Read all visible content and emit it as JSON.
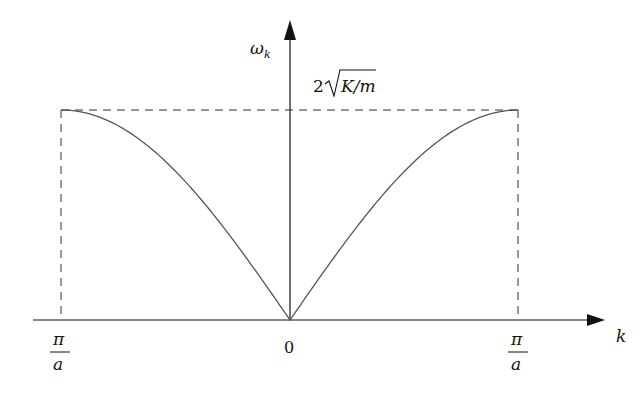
{
  "chart_data": {
    "type": "line",
    "title": "",
    "xlabel": "k",
    "ylabel": "ω_k",
    "x_ticks": [
      "-π/a",
      "0",
      "π/a"
    ],
    "x_tick_labels_shown": {
      "left": {
        "num": "π",
        "den": "a"
      },
      "center": "0",
      "right": {
        "num": "π",
        "den": "a"
      }
    },
    "y_annotation": "2√(K/m)",
    "xlim_units_pi_over_a": [
      -1,
      1
    ],
    "ylim_units_max": [
      0,
      1
    ],
    "series": [
      {
        "name": "ω_k",
        "x_units_pi_over_a": [
          -1.0,
          -0.8,
          -0.6,
          -0.4,
          -0.2,
          0.0,
          0.2,
          0.4,
          0.6,
          0.8,
          1.0
        ],
        "y_units_of_max": [
          1.0,
          0.951,
          0.809,
          0.588,
          0.309,
          0.0,
          0.309,
          0.588,
          0.809,
          0.951,
          1.0
        ]
      }
    ],
    "guides": {
      "dashed_horizontal_at_max": true,
      "dashed_vertical_at_zone_edges": true
    },
    "grid": false,
    "legend": null
  },
  "labels": {
    "y_axis": "ω",
    "y_axis_sub": "k",
    "max_value_prefix": "2",
    "max_value_radicand": "K/m",
    "x_axis": "k",
    "origin": "0",
    "left_edge_num": "π",
    "left_edge_den": "a",
    "right_edge_num": "π",
    "right_edge_den": "a"
  },
  "colors": {
    "axis": "#111111",
    "curve": "#555555",
    "dashed": "#333333"
  }
}
